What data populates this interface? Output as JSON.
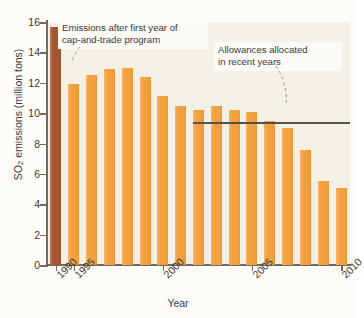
{
  "chart_data": {
    "type": "bar",
    "title": "",
    "xlabel": "Year",
    "ylabel": "SO2 emissions (million tons)",
    "ylabel_rich": "SO₂ emissions (million tons)",
    "categories": [
      1990,
      1995,
      1996,
      1997,
      1998,
      1999,
      2000,
      2001,
      2002,
      2003,
      2004,
      2005,
      2006,
      2007,
      2008,
      2009,
      2010
    ],
    "values": [
      15.7,
      11.9,
      12.5,
      12.9,
      13.0,
      12.4,
      11.1,
      10.5,
      10.2,
      10.5,
      10.2,
      10.1,
      9.5,
      9.0,
      7.6,
      5.5,
      5.1
    ],
    "bar_colors": [
      "#a3572f",
      "#f2a13e",
      "#f2a13e",
      "#f2a13e",
      "#f2a13e",
      "#f2a13e",
      "#f2a13e",
      "#f2a13e",
      "#f2a13e",
      "#f2a13e",
      "#f2a13e",
      "#f2a13e",
      "#f2a13e",
      "#f2a13e",
      "#f2a13e",
      "#f2a13e",
      "#f2a13e"
    ],
    "ylim": [
      0,
      16
    ],
    "yticks": [
      0,
      2,
      4,
      6,
      8,
      10,
      12,
      14,
      16
    ],
    "xticks": [
      1990,
      1995,
      2000,
      2005,
      2010
    ],
    "grid": false,
    "legend": "none",
    "reference_line": {
      "label": "Allowances allocated in recent years",
      "value": 9.4,
      "start_category": 2002,
      "end_category": 2010,
      "color": "#57534b"
    },
    "annotations": [
      {
        "text_line1": "Emissions after first year of",
        "text_line2": "cap-and-trade program",
        "points_to_category": 1995
      },
      {
        "text_line1": "Allowances allocated",
        "text_line2": "in recent years",
        "points_to_category": 2008
      }
    ]
  },
  "colors": {
    "plot_background": "#f4f0e6",
    "page_background": "#fdfcf8",
    "bar_orange": "#f2a13e",
    "bar_brown": "#a3572f",
    "axis": "#6d6a63",
    "text": "#3a3a3a"
  }
}
